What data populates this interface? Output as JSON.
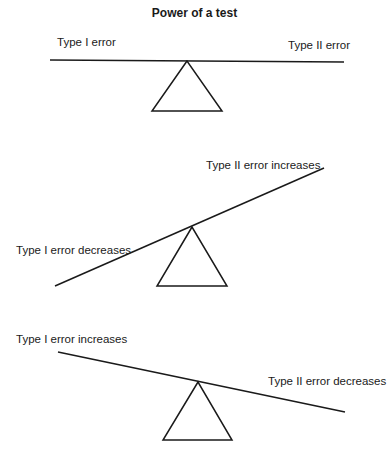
{
  "title": "Power of a test",
  "panels": [
    {
      "state": "balanced",
      "left_label": "Type I error",
      "right_label": "Type II error"
    },
    {
      "state": "tilted-right-up",
      "left_label": "Type I error decreases",
      "right_label": "Type II error increases"
    },
    {
      "state": "tilted-left-up",
      "left_label": "Type I error increases",
      "right_label": "Type II error decreases"
    }
  ],
  "colors": {
    "line": "#1a1a1a",
    "background": "#ffffff"
  }
}
